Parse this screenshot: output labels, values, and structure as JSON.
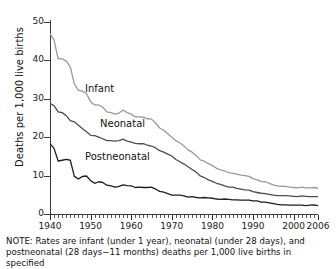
{
  "chart_data": {
    "type": "line",
    "title": "",
    "xlabel": "",
    "ylabel": "Deaths per 1,000 live births",
    "xlim": [
      1940,
      2006
    ],
    "ylim": [
      0,
      50
    ],
    "yticks": [
      0,
      10,
      20,
      30,
      40,
      50
    ],
    "xticks": [
      1940,
      1950,
      1960,
      1970,
      1980,
      1990,
      2000,
      2006
    ],
    "xtick_labels": [
      "1940",
      "1950",
      "1960",
      "1970",
      "1980",
      "1990",
      "2000",
      "2006"
    ],
    "ytick_labels": [
      "0",
      "10",
      "20",
      "30",
      "40",
      "50"
    ],
    "grid": false,
    "legend_position": "inline-annotations",
    "minor_ticks": "annual",
    "x": [
      1940,
      1941,
      1942,
      1943,
      1944,
      1945,
      1946,
      1947,
      1948,
      1949,
      1950,
      1951,
      1952,
      1953,
      1954,
      1955,
      1956,
      1957,
      1958,
      1959,
      1960,
      1961,
      1962,
      1963,
      1964,
      1965,
      1966,
      1967,
      1968,
      1969,
      1970,
      1971,
      1972,
      1973,
      1974,
      1975,
      1976,
      1977,
      1978,
      1979,
      1980,
      1981,
      1982,
      1983,
      1984,
      1985,
      1986,
      1987,
      1988,
      1989,
      1990,
      1991,
      1992,
      1993,
      1994,
      1995,
      1996,
      1997,
      1998,
      1999,
      2000,
      2001,
      2002,
      2003,
      2004,
      2005,
      2006
    ],
    "series": [
      {
        "name": "Infant",
        "color": "#9a9a9a",
        "label": "Infant",
        "values": [
          47.0,
          45.3,
          40.4,
          40.4,
          39.8,
          38.3,
          33.8,
          32.2,
          32.0,
          31.3,
          29.2,
          28.4,
          28.4,
          27.8,
          26.6,
          26.4,
          26.0,
          26.3,
          27.1,
          26.4,
          26.0,
          25.3,
          25.3,
          25.2,
          24.8,
          24.7,
          23.7,
          22.4,
          21.8,
          20.9,
          20.0,
          19.1,
          18.5,
          17.7,
          16.7,
          16.1,
          15.2,
          14.1,
          13.8,
          13.1,
          12.6,
          11.9,
          11.5,
          11.2,
          10.8,
          10.6,
          10.4,
          10.1,
          10.0,
          9.8,
          9.2,
          8.9,
          8.5,
          8.4,
          8.0,
          7.6,
          7.3,
          7.2,
          7.2,
          7.0,
          6.9,
          6.8,
          7.0,
          6.8,
          6.8,
          6.9,
          6.7
        ]
      },
      {
        "name": "Neonatal",
        "color": "#4d4d4d",
        "label": "Neonatal",
        "values": [
          28.8,
          28.2,
          26.6,
          26.4,
          25.6,
          24.3,
          24.0,
          23.1,
          22.2,
          21.4,
          20.5,
          20.4,
          20.0,
          19.6,
          19.1,
          19.1,
          19.0,
          19.1,
          19.5,
          19.0,
          18.7,
          18.4,
          18.3,
          18.3,
          17.9,
          17.7,
          17.2,
          16.5,
          16.1,
          15.6,
          15.1,
          14.2,
          13.6,
          13.0,
          12.3,
          11.6,
          10.9,
          9.9,
          9.5,
          8.9,
          8.5,
          8.0,
          7.7,
          7.3,
          7.0,
          7.0,
          6.7,
          6.5,
          6.3,
          6.2,
          5.8,
          5.6,
          5.4,
          5.3,
          5.1,
          4.9,
          4.8,
          4.8,
          4.8,
          4.7,
          4.6,
          4.5,
          4.7,
          4.6,
          4.5,
          4.5,
          4.5
        ]
      },
      {
        "name": "Postneonatal",
        "color": "#1f1f1f",
        "label": "Postneonatal",
        "values": [
          18.3,
          17.1,
          13.8,
          14.0,
          14.2,
          14.0,
          9.8,
          9.1,
          9.8,
          9.9,
          8.7,
          8.0,
          8.4,
          8.2,
          7.5,
          7.3,
          7.0,
          7.2,
          7.6,
          7.4,
          7.3,
          6.9,
          7.0,
          6.9,
          6.9,
          7.0,
          6.5,
          5.9,
          5.7,
          5.3,
          4.9,
          4.9,
          4.9,
          4.7,
          4.4,
          4.5,
          4.3,
          4.2,
          4.3,
          4.2,
          4.1,
          3.9,
          3.8,
          3.9,
          3.8,
          3.7,
          3.7,
          3.6,
          3.6,
          3.6,
          3.4,
          3.4,
          3.1,
          3.1,
          2.9,
          2.7,
          2.5,
          2.4,
          2.4,
          2.3,
          2.3,
          2.3,
          2.3,
          2.2,
          2.3,
          2.4,
          2.2
        ]
      }
    ]
  },
  "axis": {
    "y_title": "Deaths per 1,000 live births"
  },
  "annotations": {
    "infant": "Infant",
    "neonatal": "Neonatal",
    "postneonatal": "Postneonatal"
  },
  "note": {
    "line1": "NOTE: Rates are infant (under 1 year), neonatal (under 28 days), and",
    "line2": "postneonatal (28 days−11 months) deaths per 1,000 live births in specified"
  }
}
